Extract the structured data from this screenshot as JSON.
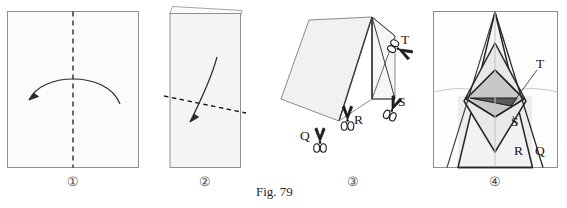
{
  "figure": {
    "caption": "Fig. 79",
    "panel_count": 4
  },
  "colors": {
    "paper_fill": "#f2f2f2",
    "paper_fill_light": "#f7f7f7",
    "paper_fill_mid": "#e4e4e4",
    "paper_fill_dark": "#b8b8b8",
    "outline": "#8a8a8a",
    "outline_strong": "#1f1f1f",
    "crease_faint": "#c9c9c9",
    "dashed": "#1a1a1a",
    "arrow": "#2b2b2b",
    "label_text": "#1a1a1a",
    "number_text": "#4a4a4a",
    "background": "#ffffff"
  },
  "panels": [
    {
      "id": "panel-1",
      "number": "①",
      "description": "square sheet of paper with vertical centre valley-fold line and a curved fold arrow sweeping to the left",
      "elements": {
        "sheet": "square-sheet",
        "fold_line": "vertical-dashed-fold-line",
        "arrow": "curved-fold-arrow-left"
      }
    },
    {
      "id": "panel-2",
      "number": "②",
      "description": "paper folded in half vertically, a slanted dashed fold line across the lower middle and a curved arrow pointing down-left",
      "elements": {
        "sheet": "folded-half-sheet",
        "top_sliver": "back-layer-edge",
        "fold_line": "diagonal-dashed-fold-line",
        "arrow": "curved-fold-arrow-down-left"
      }
    },
    {
      "id": "panel-3",
      "number": "③",
      "description": "folded model seen in three-quarter view with four cut positions marked by scissors",
      "scissor_labels": [
        "T",
        "S",
        "R",
        "Q"
      ],
      "elements": {
        "flap": "large-left-flap",
        "body": "right-rectangular-body",
        "creases": "diagonal-crease-lines",
        "scissors": "cut-position-scissors"
      }
    },
    {
      "id": "panel-4",
      "number": "④",
      "description": "unfolded result, symmetric pointed pattern with nested outlines and a shaded central diamond; cut edges labelled",
      "labels": [
        "T",
        "S",
        "R",
        "Q"
      ],
      "elements": {
        "sheet": "unfolded-square-sheet",
        "outer_spire": "outer-pointed-outline",
        "inner_spire": "inner-pointed-outline",
        "centre_diamond": "shaded-centre-diamond",
        "centre_triangle": "dark-centre-triangle",
        "axis": "vertical-centre-crease",
        "horizontal": "horizontal-crease"
      }
    }
  ],
  "labels": {
    "T": "T",
    "S": "S",
    "R": "R",
    "Q": "Q"
  }
}
